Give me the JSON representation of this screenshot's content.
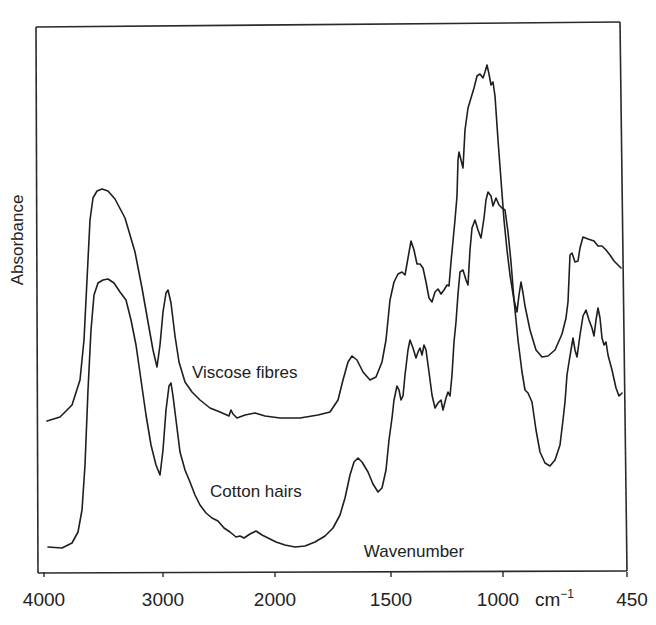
{
  "chart_data": {
    "type": "line",
    "title": "",
    "xlabel": "Wavenumber",
    "x_unit": "cm-1",
    "ylabel": "Absorbance",
    "x_reversed": true,
    "x_range": [
      4000,
      450
    ],
    "x_scale_note": "Axis scale changes at 2000 cm-1 (expanded below 2000)",
    "x_ticks": [
      {
        "value": 4000,
        "label": "4000"
      },
      {
        "value": 3000,
        "label": "3000"
      },
      {
        "value": 2000,
        "label": "2000"
      },
      {
        "value": 1500,
        "label": "1500"
      },
      {
        "value": 1000,
        "label": "1000"
      },
      {
        "value": 450,
        "label": "450"
      }
    ],
    "y_ticks": [],
    "grid": false,
    "legend": "inline labels",
    "series": [
      {
        "name": "Viscose fibres",
        "label_position": {
          "x": 192,
          "y": 378
        },
        "points_px": [
          [
            47,
            421
          ],
          [
            60,
            417
          ],
          [
            72,
            405
          ],
          [
            80,
            380
          ],
          [
            84,
            340
          ],
          [
            87,
            280
          ],
          [
            90,
            220
          ],
          [
            93,
            198
          ],
          [
            97,
            191
          ],
          [
            102,
            189
          ],
          [
            108,
            191
          ],
          [
            115,
            199
          ],
          [
            125,
            218
          ],
          [
            135,
            252
          ],
          [
            142,
            288
          ],
          [
            148,
            322
          ],
          [
            153,
            350
          ],
          [
            157,
            367
          ],
          [
            160,
            345
          ],
          [
            163,
            312
          ],
          [
            166,
            293
          ],
          [
            168,
            290
          ],
          [
            171,
            303
          ],
          [
            175,
            336
          ],
          [
            179,
            362
          ],
          [
            185,
            382
          ],
          [
            192,
            392
          ],
          [
            200,
            400
          ],
          [
            210,
            408
          ],
          [
            220,
            412
          ],
          [
            229,
            416
          ],
          [
            231,
            410
          ],
          [
            233,
            414
          ],
          [
            237,
            418
          ],
          [
            245,
            415
          ],
          [
            255,
            413
          ],
          [
            265,
            416
          ],
          [
            280,
            418
          ],
          [
            300,
            418
          ],
          [
            318,
            415
          ],
          [
            330,
            412
          ],
          [
            338,
            400
          ],
          [
            343,
            380
          ],
          [
            348,
            362
          ],
          [
            352,
            356
          ],
          [
            357,
            360
          ],
          [
            363,
            372
          ],
          [
            370,
            380
          ],
          [
            376,
            377
          ],
          [
            382,
            362
          ],
          [
            386,
            340
          ],
          [
            390,
            300
          ],
          [
            394,
            282
          ],
          [
            398,
            274
          ],
          [
            402,
            272
          ],
          [
            405,
            275
          ],
          [
            408,
            258
          ],
          [
            411,
            241
          ],
          [
            414,
            250
          ],
          [
            417,
            264
          ],
          [
            420,
            264
          ],
          [
            423,
            268
          ],
          [
            426,
            282
          ],
          [
            429,
            298
          ],
          [
            432,
            302
          ],
          [
            435,
            292
          ],
          [
            438,
            289
          ],
          [
            441,
            294
          ],
          [
            444,
            290
          ],
          [
            447,
            285
          ],
          [
            449,
            286
          ],
          [
            451,
            262
          ],
          [
            453,
            241
          ],
          [
            455,
            220
          ],
          [
            457,
            196
          ],
          [
            458,
            160
          ],
          [
            459,
            152
          ],
          [
            461,
            160
          ],
          [
            463,
            168
          ],
          [
            465,
            130
          ],
          [
            468,
            108
          ],
          [
            471,
            98
          ],
          [
            474,
            88
          ],
          [
            477,
            76
          ],
          [
            480,
            74
          ],
          [
            483,
            78
          ],
          [
            485,
            72
          ],
          [
            487,
            65
          ],
          [
            489,
            74
          ],
          [
            491,
            85
          ],
          [
            493,
            82
          ],
          [
            495,
            96
          ],
          [
            498,
            140
          ],
          [
            501,
            180
          ],
          [
            504,
            220
          ],
          [
            507,
            250
          ],
          [
            510,
            275
          ],
          [
            514,
            300
          ],
          [
            517,
            312
          ],
          [
            519,
            295
          ],
          [
            521,
            282
          ],
          [
            523,
            293
          ],
          [
            525,
            306
          ],
          [
            530,
            330
          ],
          [
            536,
            350
          ],
          [
            542,
            357
          ],
          [
            548,
            356
          ],
          [
            555,
            350
          ],
          [
            562,
            334
          ],
          [
            566,
            318
          ],
          [
            568,
            302
          ],
          [
            570,
            255
          ],
          [
            572,
            253
          ],
          [
            575,
            262
          ],
          [
            578,
            261
          ],
          [
            580,
            248
          ],
          [
            583,
            237
          ],
          [
            588,
            239
          ],
          [
            594,
            241
          ],
          [
            598,
            246
          ],
          [
            602,
            246
          ],
          [
            606,
            250
          ],
          [
            610,
            255
          ],
          [
            614,
            261
          ],
          [
            618,
            265
          ],
          [
            621,
            268
          ]
        ]
      },
      {
        "name": "Cotton hairs",
        "label_position": {
          "x": 210,
          "y": 497
        },
        "points_px": [
          [
            48,
            547
          ],
          [
            62,
            548
          ],
          [
            72,
            543
          ],
          [
            78,
            532
          ],
          [
            82,
            510
          ],
          [
            85,
            465
          ],
          [
            88,
            390
          ],
          [
            91,
            330
          ],
          [
            94,
            295
          ],
          [
            98,
            283
          ],
          [
            103,
            280
          ],
          [
            108,
            279
          ],
          [
            114,
            283
          ],
          [
            120,
            292
          ],
          [
            126,
            300
          ],
          [
            131,
            320
          ],
          [
            136,
            345
          ],
          [
            141,
            380
          ],
          [
            146,
            415
          ],
          [
            151,
            445
          ],
          [
            156,
            465
          ],
          [
            160,
            475
          ],
          [
            163,
            450
          ],
          [
            166,
            410
          ],
          [
            169,
            386
          ],
          [
            171,
            383
          ],
          [
            173,
            396
          ],
          [
            176,
            420
          ],
          [
            180,
            452
          ],
          [
            185,
            470
          ],
          [
            190,
            482
          ],
          [
            195,
            495
          ],
          [
            200,
            505
          ],
          [
            206,
            513
          ],
          [
            212,
            518
          ],
          [
            218,
            521
          ],
          [
            224,
            528
          ],
          [
            230,
            532
          ],
          [
            236,
            537
          ],
          [
            240,
            536
          ],
          [
            244,
            538
          ],
          [
            250,
            534
          ],
          [
            256,
            531
          ],
          [
            262,
            535
          ],
          [
            268,
            538
          ],
          [
            276,
            542
          ],
          [
            285,
            545
          ],
          [
            295,
            547
          ],
          [
            305,
            546
          ],
          [
            315,
            542
          ],
          [
            325,
            536
          ],
          [
            333,
            528
          ],
          [
            340,
            515
          ],
          [
            345,
            498
          ],
          [
            350,
            475
          ],
          [
            354,
            462
          ],
          [
            358,
            458
          ],
          [
            362,
            462
          ],
          [
            368,
            472
          ],
          [
            373,
            484
          ],
          [
            378,
            492
          ],
          [
            382,
            488
          ],
          [
            386,
            470
          ],
          [
            389,
            440
          ],
          [
            392,
            418
          ],
          [
            394,
            400
          ],
          [
            397,
            386
          ],
          [
            399,
            390
          ],
          [
            401,
            400
          ],
          [
            403,
            396
          ],
          [
            405,
            375
          ],
          [
            408,
            350
          ],
          [
            410,
            340
          ],
          [
            413,
            348
          ],
          [
            416,
            358
          ],
          [
            418,
            352
          ],
          [
            420,
            348
          ],
          [
            422,
            355
          ],
          [
            424,
            345
          ],
          [
            426,
            350
          ],
          [
            429,
            372
          ],
          [
            432,
            395
          ],
          [
            435,
            408
          ],
          [
            438,
            403
          ],
          [
            441,
            400
          ],
          [
            443,
            410
          ],
          [
            446,
            398
          ],
          [
            448,
            392
          ],
          [
            450,
            396
          ],
          [
            452,
            375
          ],
          [
            454,
            342
          ],
          [
            456,
            322
          ],
          [
            458,
            294
          ],
          [
            460,
            272
          ],
          [
            463,
            270
          ],
          [
            466,
            280
          ],
          [
            468,
            285
          ],
          [
            470,
            250
          ],
          [
            472,
            228
          ],
          [
            475,
            220
          ],
          [
            478,
            230
          ],
          [
            481,
            238
          ],
          [
            484,
            218
          ],
          [
            486,
            200
          ],
          [
            488,
            192
          ],
          [
            491,
            196
          ],
          [
            493,
            206
          ],
          [
            496,
            198
          ],
          [
            499,
            205
          ],
          [
            502,
            208
          ],
          [
            505,
            210
          ],
          [
            508,
            232
          ],
          [
            511,
            262
          ],
          [
            514,
            300
          ],
          [
            518,
            340
          ],
          [
            522,
            372
          ],
          [
            525,
            390
          ],
          [
            528,
            393
          ],
          [
            532,
            402
          ],
          [
            536,
            430
          ],
          [
            540,
            452
          ],
          [
            545,
            463
          ],
          [
            550,
            466
          ],
          [
            555,
            460
          ],
          [
            560,
            445
          ],
          [
            563,
            420
          ],
          [
            565,
            402
          ],
          [
            567,
            375
          ],
          [
            569,
            362
          ],
          [
            571,
            350
          ],
          [
            573,
            338
          ],
          [
            575,
            350
          ],
          [
            577,
            357
          ],
          [
            580,
            335
          ],
          [
            583,
            316
          ],
          [
            586,
            310
          ],
          [
            589,
            320
          ],
          [
            592,
            328
          ],
          [
            594,
            336
          ],
          [
            596,
            320
          ],
          [
            598,
            308
          ],
          [
            600,
            318
          ],
          [
            602,
            338
          ],
          [
            604,
            345
          ],
          [
            606,
            342
          ],
          [
            608,
            355
          ],
          [
            612,
            370
          ],
          [
            616,
            388
          ],
          [
            619,
            396
          ],
          [
            622,
            393
          ]
        ]
      }
    ]
  },
  "axis": {
    "y_title": "Absorbance",
    "x_title": "Wavenumber",
    "unit_base": "cm",
    "unit_exp": "−1",
    "tick_labels": [
      "4000",
      "3000",
      "2000",
      "1500",
      "1000",
      "450"
    ]
  },
  "labels": {
    "viscose": "Viscose fibres",
    "cotton": "Cotton hairs"
  }
}
